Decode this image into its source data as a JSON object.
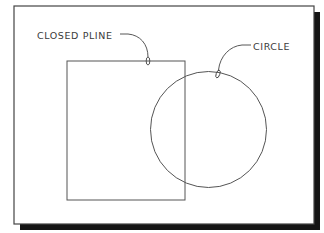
{
  "diagram": {
    "canvas": {
      "width": 324,
      "height": 233,
      "background": "#ffffff"
    },
    "frame": {
      "x": 14,
      "y": 6,
      "width": 300,
      "height": 218,
      "stroke": "#444444",
      "shadow": {
        "offset": 6,
        "color": "#151515"
      }
    },
    "shapes": {
      "closed_pline": {
        "type": "rectangle",
        "x": 67,
        "y": 61,
        "width": 118,
        "height": 139,
        "stroke": "#555555"
      },
      "circle": {
        "type": "circle",
        "cx": 208.5,
        "cy": 129.5,
        "r": 58,
        "stroke": "#555555"
      }
    },
    "labels": {
      "closed_pline": {
        "text": "CLOSED PLINE",
        "x": 37,
        "y": 39
      },
      "circle": {
        "text": "CIRCLE",
        "x": 253,
        "y": 50
      }
    },
    "leaders": {
      "closed_pline": {
        "path": "M120,34 L128,34 C140,35 148,44 148,57",
        "pick": {
          "cx": 148,
          "cy": 61,
          "rx": 1.8,
          "ry": 4
        }
      },
      "circle": {
        "path": "M251,45 L242,45 C230,46 220,56 218.5,70",
        "pick": {
          "cx": 218,
          "cy": 74,
          "rx": 1.8,
          "ry": 4,
          "rotate": 20
        }
      }
    }
  }
}
